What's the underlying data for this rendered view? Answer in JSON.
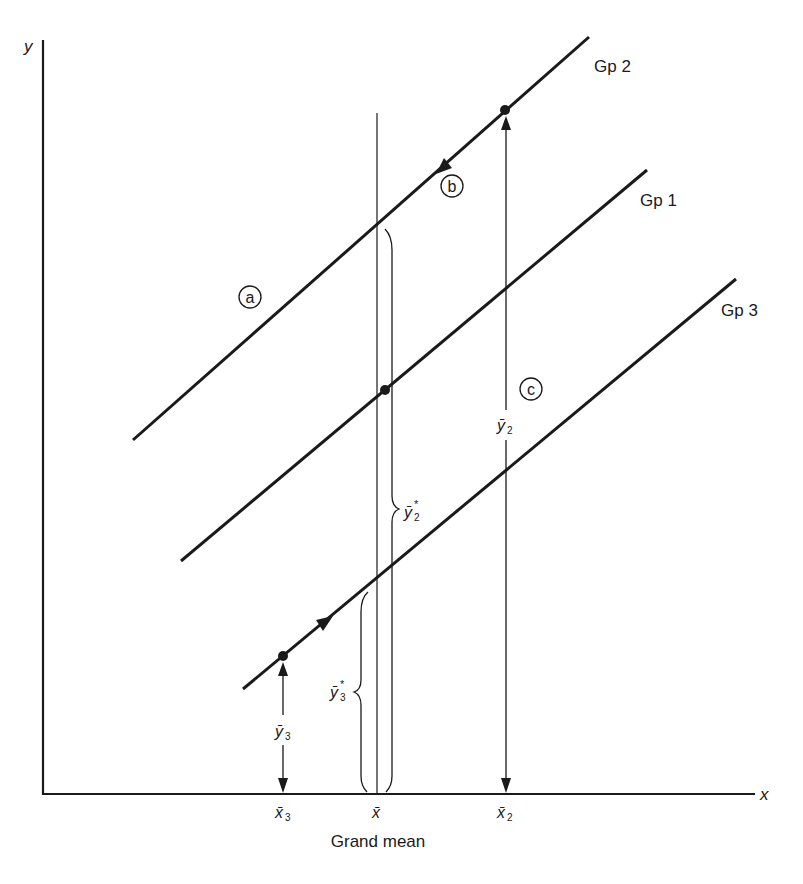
{
  "diagram": {
    "axes": {
      "x_label": "x",
      "y_label": "y"
    },
    "groups": [
      {
        "name": "Gp 2",
        "label": "Gp 2"
      },
      {
        "name": "Gp 1",
        "label": "Gp 1"
      },
      {
        "name": "Gp 3",
        "label": "Gp 3"
      }
    ],
    "circled_markers": {
      "a": "a",
      "b": "b",
      "c": "c"
    },
    "x_ticks": {
      "x3_bar": "x̄",
      "x3_sub": "3",
      "x_bar": "x̄",
      "x2_bar": "x̄",
      "x2_sub": "2"
    },
    "grand_mean_label": "Grand mean",
    "measures": {
      "y3_bar": "ȳ",
      "y3_sub": "3",
      "y2_bar": "ȳ",
      "y2_sub": "2",
      "y2_star": "ȳ",
      "y2_star_sub": "2",
      "y3_star": "ȳ",
      "y3_star_sub": "3",
      "star": "*"
    }
  }
}
